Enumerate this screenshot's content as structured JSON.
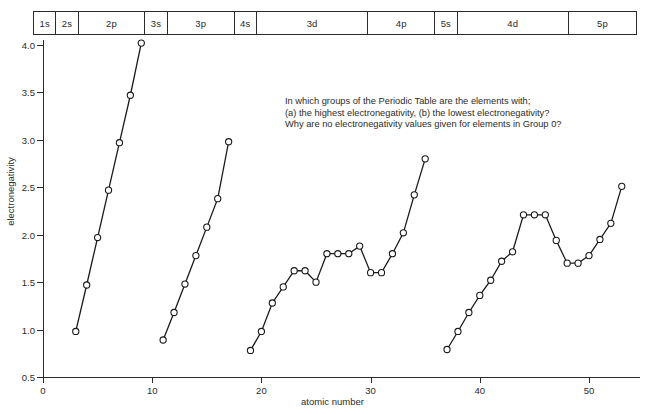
{
  "figure": {
    "question_note": [
      "In which groups of the Periodic Table are the elements with;",
      "(a) the highest electronegativity, (b) the lowest electronegativity?",
      "Why are no electronegativity values given for elements in Group 0?"
    ]
  },
  "orbital_bar": {
    "name": "orbital-filling-bar",
    "cells": [
      {
        "label": "1s",
        "start": 1,
        "end": 2
      },
      {
        "label": "2s",
        "start": 3,
        "end": 4
      },
      {
        "label": "2p",
        "start": 5,
        "end": 10
      },
      {
        "label": "3s",
        "start": 11,
        "end": 12
      },
      {
        "label": "3p",
        "start": 13,
        "end": 18
      },
      {
        "label": "4s",
        "start": 19,
        "end": 20
      },
      {
        "label": "3d",
        "start": 21,
        "end": 30
      },
      {
        "label": "4p",
        "start": 31,
        "end": 36
      },
      {
        "label": "5s",
        "start": 37,
        "end": 38
      },
      {
        "label": "4d",
        "start": 39,
        "end": 48
      },
      {
        "label": "5p",
        "start": 49,
        "end": 54
      }
    ]
  },
  "chart_data": {
    "type": "line",
    "title": "",
    "xlabel": "atomic number",
    "ylabel": "electronegativity",
    "xlim": [
      0,
      54.5
    ],
    "ylim": [
      0.5,
      4.15
    ],
    "xticks": [
      0,
      10,
      20,
      30,
      40,
      50
    ],
    "xticklabels": [
      "0",
      "10",
      "20",
      "30",
      "40",
      "50"
    ],
    "yticks": [
      0.5,
      1.0,
      1.5,
      2.0,
      2.5,
      3.0,
      3.5,
      4.0
    ],
    "yticklabels": [
      "0.5",
      "1.0",
      "1.5",
      "2.0",
      "2.5",
      "3.0",
      "3.5",
      "4.0"
    ],
    "grid": false,
    "legend": false,
    "marker": "open-circle",
    "series": [
      {
        "name": "period-2",
        "x": [
          3,
          4,
          5,
          6,
          7,
          8,
          9
        ],
        "y": [
          0.98,
          1.47,
          1.97,
          2.47,
          2.97,
          3.47,
          4.02
        ]
      },
      {
        "name": "period-3",
        "x": [
          11,
          12,
          13,
          14,
          15,
          16,
          17
        ],
        "y": [
          0.89,
          1.18,
          1.48,
          1.78,
          2.08,
          2.38,
          2.98
        ]
      },
      {
        "name": "period-4",
        "x": [
          19,
          20,
          21,
          22,
          23,
          24,
          25,
          26,
          27,
          28,
          29,
          30,
          31,
          32,
          33,
          34,
          35
        ],
        "y": [
          0.78,
          0.98,
          1.28,
          1.45,
          1.62,
          1.62,
          1.5,
          1.8,
          1.8,
          1.8,
          1.88,
          1.6,
          1.6,
          1.8,
          2.02,
          2.42,
          2.8
        ]
      },
      {
        "name": "period-5",
        "x": [
          37,
          38,
          39,
          40,
          41,
          42,
          43,
          44,
          45,
          46,
          47,
          48,
          49,
          50,
          51,
          52,
          53
        ],
        "y": [
          0.79,
          0.98,
          1.18,
          1.36,
          1.52,
          1.72,
          1.82,
          2.21,
          2.21,
          2.21,
          1.94,
          1.7,
          1.7,
          1.78,
          1.95,
          2.12,
          2.51
        ]
      }
    ]
  }
}
